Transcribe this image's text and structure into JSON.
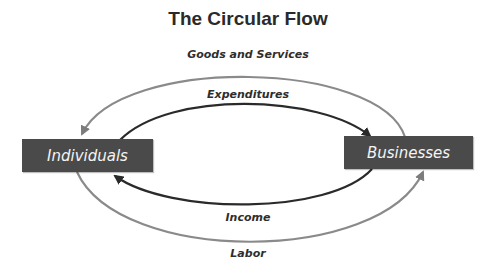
{
  "title": "The Circular Flow",
  "nodes": {
    "left": {
      "label": "Individuals"
    },
    "right": {
      "label": "Businesses"
    }
  },
  "flows": {
    "outer_top": {
      "label": "Goods and Services",
      "direction": "Businesses → Individuals",
      "color": "#8a8a8a"
    },
    "inner_top": {
      "label": "Expenditures",
      "direction": "Individuals → Businesses",
      "color": "#2a2a2a"
    },
    "inner_bottom": {
      "label": "Income",
      "direction": "Businesses → Individuals",
      "color": "#2a2a2a"
    },
    "outer_bottom": {
      "label": "Labor",
      "direction": "Individuals → Businesses",
      "color": "#8a8a8a"
    }
  },
  "colors": {
    "box_fill": "#4a4a4a",
    "box_text": "#f4f4f4",
    "outer_arrow": "#8a8a8a",
    "inner_arrow": "#2a2a2a"
  }
}
